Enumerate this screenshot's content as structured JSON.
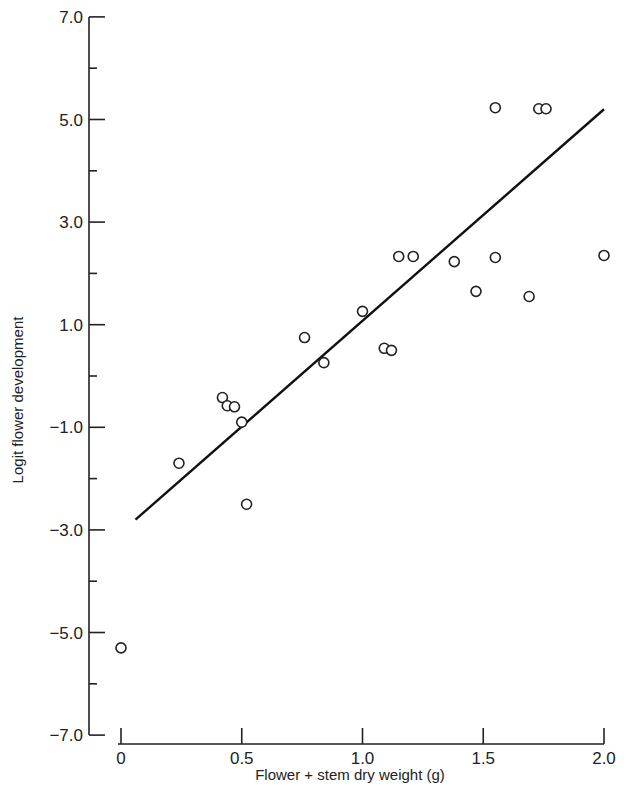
{
  "chart_data": {
    "type": "scatter",
    "title": "",
    "xlabel": "Flower + stem dry weight (g)",
    "ylabel": "Logit flower development",
    "xlim": [
      0,
      2.0
    ],
    "ylim": [
      -7.0,
      7.0
    ],
    "x_ticks": [
      0,
      0.5,
      1.0,
      1.5,
      2.0
    ],
    "x_tick_labels": [
      "0",
      "0.5",
      "1.0",
      "1.5",
      "2.0"
    ],
    "y_ticks": [
      7.0,
      5.0,
      3.0,
      1.0,
      -1.0,
      -3.0,
      -5.0,
      -7.0
    ],
    "y_tick_labels": [
      "7.0",
      "5.0",
      "3.0",
      "1.0",
      "−1.0",
      "−3.0",
      "−5.0",
      "−7.0"
    ],
    "y_minor_ticks": [
      6.0,
      4.0,
      2.0,
      0.0,
      -2.0,
      -4.0,
      -6.0
    ],
    "grid": false,
    "legend": null,
    "series": [
      {
        "name": "observations",
        "marker": "open-circle",
        "points": [
          {
            "x": 0.0,
            "y": -5.3
          },
          {
            "x": 0.24,
            "y": -1.7
          },
          {
            "x": 0.42,
            "y": -0.42
          },
          {
            "x": 0.44,
            "y": -0.58
          },
          {
            "x": 0.47,
            "y": -0.6
          },
          {
            "x": 0.5,
            "y": -0.9
          },
          {
            "x": 0.52,
            "y": -2.5
          },
          {
            "x": 0.76,
            "y": 0.75
          },
          {
            "x": 0.84,
            "y": 0.26
          },
          {
            "x": 1.0,
            "y": 1.26
          },
          {
            "x": 1.09,
            "y": 0.54
          },
          {
            "x": 1.12,
            "y": 0.5
          },
          {
            "x": 1.15,
            "y": 2.33
          },
          {
            "x": 1.21,
            "y": 2.33
          },
          {
            "x": 1.38,
            "y": 2.23
          },
          {
            "x": 1.47,
            "y": 1.65
          },
          {
            "x": 1.55,
            "y": 2.31
          },
          {
            "x": 1.55,
            "y": 5.23
          },
          {
            "x": 1.69,
            "y": 1.55
          },
          {
            "x": 1.73,
            "y": 5.21
          },
          {
            "x": 1.76,
            "y": 5.21
          },
          {
            "x": 2.0,
            "y": 2.35
          }
        ]
      },
      {
        "name": "fitted regression line",
        "type": "line",
        "points": [
          {
            "x": 0.06,
            "y": -2.8
          },
          {
            "x": 2.0,
            "y": 5.2
          }
        ]
      }
    ]
  }
}
